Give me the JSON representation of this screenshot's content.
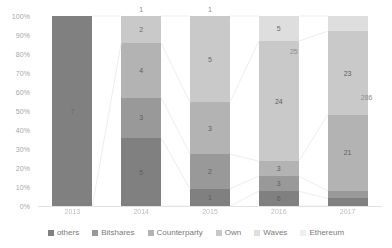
{
  "chart_data": {
    "type": "bar",
    "subtype": "100% stacked column",
    "title": "",
    "xlabel": "",
    "ylabel": "",
    "categories": [
      "2013",
      "2014",
      "2015",
      "2016",
      "2017"
    ],
    "ylim": [
      0,
      100
    ],
    "ytick_labels": [
      "100%",
      "90%",
      "80%",
      "70%",
      "60%",
      "50%",
      "40%",
      "30%",
      "20%",
      "10%",
      "0%"
    ],
    "ytick_values": [
      100,
      90,
      80,
      70,
      60,
      50,
      40,
      30,
      20,
      10,
      0
    ],
    "grid": false,
    "legend_position": "bottom",
    "series": [
      {
        "name": "others",
        "color": "#808080",
        "values": [
          7,
          5,
          1,
          6,
          1
        ],
        "percent": [
          100,
          35.7,
          9.1,
          15.8,
          2.0
        ]
      },
      {
        "name": "Bitshares",
        "color": "#999999",
        "values": [
          0,
          3,
          2,
          3,
          1
        ],
        "percent": [
          0,
          21.4,
          18.2,
          7.9,
          2.0
        ]
      },
      {
        "name": "Counterparty",
        "color": "#b3b3b3",
        "values": [
          0,
          4,
          3,
          3,
          21
        ],
        "percent": [
          0,
          28.6,
          27.3,
          7.9,
          42.0
        ]
      },
      {
        "name": "Own",
        "color": "#c9c9c9",
        "values": [
          0,
          2,
          5,
          24,
          23
        ],
        "percent": [
          0,
          14.3,
          45.4,
          63.2,
          46.0
        ]
      },
      {
        "name": "Waves",
        "color": "#dedede",
        "values": [
          0,
          0,
          0,
          5,
          3
        ],
        "percent": [
          0,
          0,
          0,
          13.2,
          6.0
        ]
      },
      {
        "name": "Ethereum",
        "color": "#eeeeee",
        "values": [
          0,
          0,
          0,
          0,
          1
        ],
        "percent": [
          0,
          0,
          0,
          0,
          2.0
        ]
      }
    ],
    "bar_totals": [
      "",
      "1",
      "1",
      "25",
      "286"
    ],
    "data_labels": {
      "bar_2013": [
        "7"
      ],
      "bar_2014": [
        "2",
        "4",
        "3",
        "5"
      ],
      "bar_2015": [
        "1",
        "5",
        "3",
        "2",
        "1"
      ],
      "bar_2016": [
        "5",
        "24",
        "3",
        "3",
        "6"
      ],
      "bar_2017": [
        "23",
        "21"
      ]
    }
  },
  "axis": {
    "y": {
      "ticks": [
        "100%",
        "90%",
        "80%",
        "70%",
        "60%",
        "50%",
        "40%",
        "30%",
        "20%",
        "10%",
        "0%"
      ]
    },
    "x": {
      "ticks": [
        "2013",
        "2014",
        "2015",
        "2016",
        "2017"
      ]
    }
  },
  "legend": {
    "items": [
      {
        "label": "others",
        "color": "#808080"
      },
      {
        "label": "Bitshares",
        "color": "#999999"
      },
      {
        "label": "Counterparty",
        "color": "#b3b3b3"
      },
      {
        "label": "Own",
        "color": "#c9c9c9"
      },
      {
        "label": "Waves",
        "color": "#dedede"
      },
      {
        "label": "Ethereum",
        "color": "#eeeeee"
      }
    ]
  },
  "bars": [
    {
      "category": "2013",
      "total_label": "",
      "segments": [
        {
          "series": "others",
          "label": "7",
          "percent": 100,
          "color": "#808080"
        }
      ]
    },
    {
      "category": "2014",
      "total_label": "1",
      "segments": [
        {
          "series": "Own",
          "label": "2",
          "percent": 14.3,
          "color": "#c9c9c9"
        },
        {
          "series": "Counterparty",
          "label": "4",
          "percent": 28.6,
          "color": "#b3b3b3"
        },
        {
          "series": "Bitshares",
          "label": "3",
          "percent": 21.4,
          "color": "#999999"
        },
        {
          "series": "others",
          "label": "5",
          "percent": 35.7,
          "color": "#808080"
        }
      ]
    },
    {
      "category": "2015",
      "total_label": "1",
      "segments": [
        {
          "series": "Own",
          "label": "5",
          "percent": 45.4,
          "color": "#c9c9c9"
        },
        {
          "series": "Counterparty",
          "label": "3",
          "percent": 27.3,
          "color": "#b3b3b3"
        },
        {
          "series": "Bitshares",
          "label": "2",
          "percent": 18.2,
          "color": "#999999"
        },
        {
          "series": "others",
          "label": "1",
          "percent": 9.1,
          "color": "#808080"
        }
      ]
    },
    {
      "category": "2016",
      "total_label": "25",
      "segments": [
        {
          "series": "Waves",
          "label": "5",
          "percent": 13.2,
          "color": "#dedede"
        },
        {
          "series": "Own",
          "label": "24",
          "percent": 63.2,
          "color": "#c9c9c9"
        },
        {
          "series": "Counterparty",
          "label": "3",
          "percent": 7.9,
          "color": "#b3b3b3"
        },
        {
          "series": "Bitshares",
          "label": "3",
          "percent": 7.9,
          "color": "#999999"
        },
        {
          "series": "others",
          "label": "6",
          "percent": 7.8,
          "color": "#808080"
        }
      ]
    },
    {
      "category": "2017",
      "total_label": "286",
      "segments": [
        {
          "series": "Waves",
          "label": "",
          "percent": 8.0,
          "color": "#dedede"
        },
        {
          "series": "Own",
          "label": "23",
          "percent": 44.0,
          "color": "#c9c9c9"
        },
        {
          "series": "Counterparty",
          "label": "21",
          "percent": 40.0,
          "color": "#b3b3b3"
        },
        {
          "series": "Bitshares",
          "label": "",
          "percent": 4.0,
          "color": "#999999"
        },
        {
          "series": "others",
          "label": "",
          "percent": 4.0,
          "color": "#808080"
        }
      ]
    }
  ]
}
